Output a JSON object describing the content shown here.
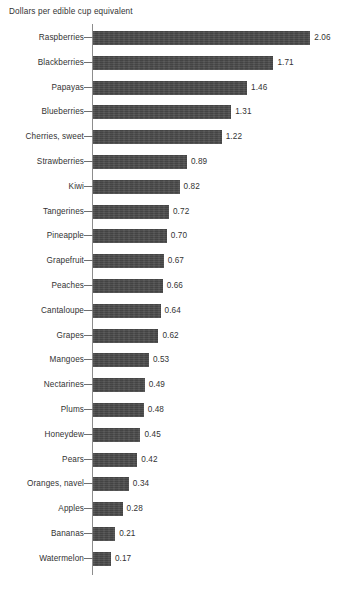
{
  "chart_data": {
    "type": "bar",
    "orientation": "horizontal",
    "title": "Dollars per edible cup equivalent",
    "xlabel": "",
    "ylabel": "",
    "xlim": [
      0,
      2.06
    ],
    "grid": false,
    "legend": null,
    "value_format": "2dp",
    "categories": [
      "Raspberries",
      "Blackberries",
      "Papayas",
      "Blueberries",
      "Cherries, sweet",
      "Strawberries",
      "Kiwi",
      "Tangerines",
      "Pineapple",
      "Grapefruit",
      "Peaches",
      "Cantaloupe",
      "Grapes",
      "Mangoes",
      "Nectarines",
      "Plums",
      "Honeydew",
      "Pears",
      "Oranges, navel",
      "Apples",
      "Bananas",
      "Watermelon"
    ],
    "values": [
      2.06,
      1.71,
      1.46,
      1.31,
      1.22,
      0.89,
      0.82,
      0.72,
      0.7,
      0.67,
      0.66,
      0.64,
      0.62,
      0.53,
      0.49,
      0.48,
      0.45,
      0.42,
      0.34,
      0.28,
      0.21,
      0.17
    ],
    "value_labels": [
      "2.06",
      "1.71",
      "1.46",
      "1.31",
      "1.22",
      "0.89",
      "0.82",
      "0.72",
      "0.70",
      "0.67",
      "0.66",
      "0.64",
      "0.62",
      "0.53",
      "0.49",
      "0.48",
      "0.45",
      "0.42",
      "0.34",
      "0.28",
      "0.21",
      "0.17"
    ],
    "colors": {
      "bar": "#4a4a4a",
      "axis": "#8d8d8d",
      "text": "#333333",
      "background": "#ffffff"
    }
  }
}
